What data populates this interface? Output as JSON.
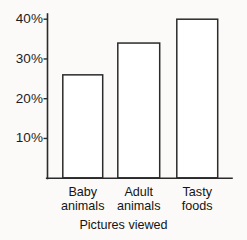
{
  "chart_data": {
    "type": "bar",
    "title": "",
    "subtitle": "",
    "xlabel": "Pictures viewed",
    "ylabel": "",
    "categories": [
      "Baby animals",
      "Adult animals",
      "Tasty foods"
    ],
    "category_lines": [
      [
        "Baby",
        "animals"
      ],
      [
        "Adult",
        "animals"
      ],
      [
        "Tasty",
        "foods"
      ]
    ],
    "values": [
      26,
      34,
      40
    ],
    "value_unit": "%",
    "ylim": [
      0,
      44
    ],
    "yticks": [
      10,
      20,
      30,
      40
    ],
    "ytick_labels": [
      "10%",
      "20%",
      "30%",
      "40%"
    ],
    "grid": false,
    "legend": false,
    "bar_fill": "#ffffff",
    "bar_stroke": "#2b2b2b",
    "axis_color": "#2b2b2b",
    "background": "#fbfaf8"
  }
}
